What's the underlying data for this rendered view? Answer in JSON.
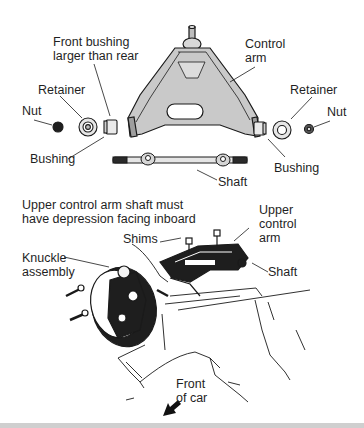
{
  "figure": {
    "type": "exploded-parts-diagram",
    "top_section": {
      "labels": {
        "front_bushing_note": "Front bushing\nlarger than rear",
        "control_arm": "Control\narm",
        "retainer_left": "Retainer",
        "retainer_right": "Retainer",
        "nut_left": "Nut",
        "nut_right": "Nut",
        "bushing_left": "Bushing",
        "bushing_right": "Bushing",
        "shaft": "Shaft"
      }
    },
    "bottom_section": {
      "labels": {
        "instruction_note": "Upper control arm shaft must\nhave depression facing inboard",
        "upper_control_arm": "Upper\ncontrol\narm",
        "shims": "Shims",
        "knuckle_assembly": "Knuckle\nassembly",
        "shaft": "Shaft",
        "front_of_car": "Front\nof car"
      }
    },
    "colors": {
      "line": "#1a1a1a",
      "part_fill": "#c9c9c9",
      "part_fill_light": "#e2e2e2",
      "background": "#ffffff",
      "bottom_bar": "#cfcfcf"
    }
  }
}
